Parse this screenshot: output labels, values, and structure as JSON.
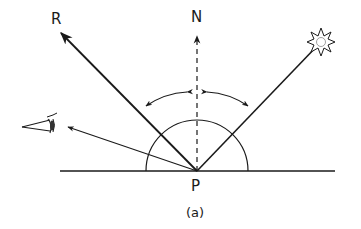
{
  "diagram": {
    "caption": "(a)",
    "labels": {
      "reflected": "R",
      "normal": "N",
      "point": "P"
    },
    "elements": [
      {
        "id": "surface",
        "type": "line",
        "description": "horizontal surface"
      },
      {
        "id": "normal",
        "type": "dashed-arrow",
        "label": "N"
      },
      {
        "id": "reflected-ray",
        "type": "arrow",
        "label": "R"
      },
      {
        "id": "incident-ray",
        "type": "line",
        "from": "light-source",
        "to": "P"
      },
      {
        "id": "view-ray",
        "type": "arrow",
        "to": "eye"
      },
      {
        "id": "hemisphere",
        "type": "semicircle",
        "center": "P"
      },
      {
        "id": "angle-arcs",
        "type": "double-arrow-arcs",
        "description": "equal angles of incidence and reflection"
      }
    ],
    "icons": {
      "light_source": "sun-burst-icon",
      "viewer": "eye-icon"
    },
    "colors": {
      "stroke": "#1a1a1a",
      "background": "#ffffff"
    }
  }
}
